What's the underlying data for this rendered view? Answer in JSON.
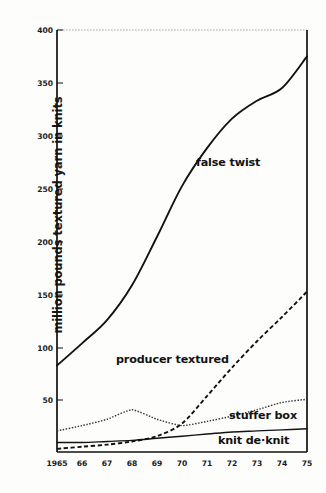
{
  "chart_data": {
    "type": "line",
    "title": "",
    "xlabel": "",
    "ylabel": "million pounds textured yarn in knits",
    "xlim": [
      1965,
      1975
    ],
    "ylim": [
      0,
      400
    ],
    "grid": false,
    "legend_position": "inline-annotations",
    "x": [
      1965,
      1966,
      1967,
      1968,
      1969,
      1970,
      1971,
      1972,
      1973,
      1974,
      1975
    ],
    "xtick_labels": [
      "1965",
      "66",
      "67",
      "68",
      "69",
      "70",
      "71",
      "72",
      "73",
      "74",
      "75"
    ],
    "ytick_labels": [
      "50",
      "100",
      "150",
      "200",
      "250",
      "300",
      "350",
      "400"
    ],
    "ytick_values": [
      50,
      100,
      150,
      200,
      250,
      300,
      350,
      400
    ],
    "series": [
      {
        "name": "false twist",
        "style": "solid",
        "values": [
          82,
          103,
          125,
          158,
          204,
          252,
          288,
          316,
          333,
          345,
          375
        ]
      },
      {
        "name": "producer textured",
        "style": "dashed",
        "values": [
          3,
          5,
          7,
          10,
          15,
          27,
          53,
          80,
          105,
          128,
          152
        ]
      },
      {
        "name": "stuffer box",
        "style": "dotted",
        "values": [
          20,
          25,
          31,
          40,
          31,
          25,
          29,
          34,
          40,
          47,
          50
        ]
      },
      {
        "name": "knit de·knit",
        "style": "solid-thin",
        "values": [
          9,
          9,
          10,
          11,
          13,
          15,
          17,
          19,
          20,
          21,
          22
        ]
      }
    ],
    "annotations": [
      {
        "text": "false twist",
        "x": 1972.1,
        "y": 258
      },
      {
        "text": "producer textured",
        "x": 1969.6,
        "y": 103
      },
      {
        "text": "stuffer box",
        "x": 1973.3,
        "y": 35
      },
      {
        "text": "knit de·knit",
        "x": 1973.1,
        "y": 11
      }
    ]
  }
}
